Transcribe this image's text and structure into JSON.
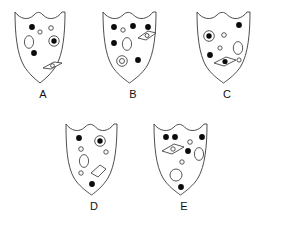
{
  "figure": {
    "type": "multiple-choice-shield-options",
    "background_color": "#ffffff",
    "outline_color": "#3a3a3a",
    "fill_color": "#ffffff",
    "dot_color": "#0b0b0b",
    "label_color": "#111111",
    "option_count": 5
  },
  "options": [
    {
      "label": "A",
      "marks_summary": "3 filled dots, 1 small open circle, 1 large ellipse, 1 bullseye, 1 diamond containing small circle",
      "counts": {
        "filled_dots": 3,
        "open_circles": 1,
        "ellipses": 1,
        "bullseyes": 1,
        "diamonds": 1
      },
      "diamond_content": "small-open-circle"
    },
    {
      "label": "B",
      "marks_summary": "4 filled dots, 1 small open circle, 1 large ellipse, 1 concentric double ring, 1 diamond containing small circle",
      "counts": {
        "filled_dots": 4,
        "open_circles": 1,
        "ellipses": 1,
        "bullseyes": 1,
        "diamonds": 1
      },
      "diamond_content": "small-open-circle"
    },
    {
      "label": "C",
      "marks_summary": "3 filled dots, 1 bullseye, 2 small open circles, 1 large ellipse, 1 diamond containing filled dot",
      "counts": {
        "filled_dots": 3,
        "open_circles": 2,
        "ellipses": 1,
        "bullseyes": 1,
        "diamonds": 1
      },
      "diamond_content": "filled-dot"
    },
    {
      "label": "D",
      "marks_summary": "2 filled dots, 1 bullseye, 3 small open circles, 1 large ellipse, 1 empty diamond",
      "counts": {
        "filled_dots": 2,
        "open_circles": 3,
        "ellipses": 1,
        "bullseyes": 1,
        "diamonds": 1
      },
      "diamond_content": "empty"
    },
    {
      "label": "E",
      "marks_summary": "5 filled dots, 2 small open circles, 1 large ellipse, 1 large open circle, 1 diamond containing small circle",
      "counts": {
        "filled_dots": 5,
        "open_circles": 2,
        "ellipses": 2,
        "bullseyes": 0,
        "diamonds": 1
      },
      "diamond_content": "small-open-circle"
    }
  ]
}
